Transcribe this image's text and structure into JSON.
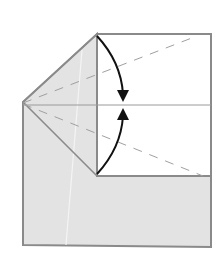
{
  "diagram": {
    "type": "origami-fold-step",
    "colors": {
      "background": "#ffffff",
      "paper_back": "#e3e3e3",
      "paper_front": "#ffffff",
      "edge": "#8a8a8a",
      "crease": "#9a9a9a",
      "dashed_valley": "#a0a0a0",
      "arrow": "#111111",
      "highlight_line": "#f4f4f4"
    },
    "shapes": {
      "outer_left_polygon": "23,102 97,34 97,176 211,176 211,247 23,245",
      "white_panel": "97,34 211,34 211,176 97,176",
      "middle_crease": {
        "x1": 23,
        "y1": 105,
        "x2": 211,
        "y2": 105
      },
      "upper_diagonal_edge": {
        "x1": 23,
        "y1": 102,
        "x2": 97,
        "y2": 34
      },
      "lower_diagonal_edge": {
        "x1": 23,
        "y1": 102,
        "x2": 97,
        "y2": 176
      },
      "valley_fold_upper": {
        "x1": 23,
        "y1": 103,
        "x2": 197,
        "y2": 36
      },
      "valley_fold_lower": {
        "x1": 23,
        "y1": 104,
        "x2": 203,
        "y2": 176
      }
    },
    "arrows": [
      {
        "name": "fold-down-arrow",
        "path": "M97,36 Q121,62 123,96",
        "head": "117,90 129,90 123,102"
      },
      {
        "name": "fold-up-arrow",
        "path": "M97,174 Q121,148 123,114",
        "head": "117,120 129,120 123,108"
      }
    ]
  }
}
